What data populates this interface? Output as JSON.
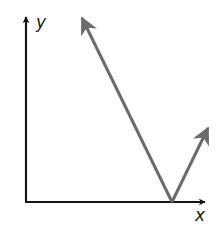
{
  "diagram": {
    "type": "vector-diagram",
    "axes": {
      "x_label": "x",
      "y_label": "y",
      "origin": [
        26,
        202
      ],
      "x_end": [
        206,
        202
      ],
      "y_end": [
        26,
        16
      ],
      "color": "#141414"
    },
    "vectors": [
      {
        "name": "long-vector",
        "from": [
          172,
          202
        ],
        "to": [
          82,
          18
        ],
        "color": "#6b6b6b"
      },
      {
        "name": "short-vector",
        "from": [
          172,
          202
        ],
        "to": [
          208,
          128
        ],
        "color": "#6b6b6b"
      }
    ]
  }
}
